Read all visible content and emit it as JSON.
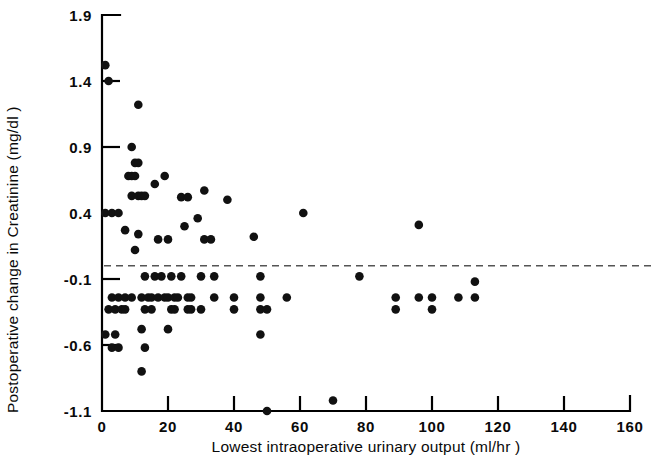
{
  "chart_data": {
    "type": "scatter",
    "title": "",
    "xlabel": "Lowest intraoperative urinary output  (ml/hr )",
    "ylabel": "Postoperative change in Creatinine (mg/dl )",
    "xlim": [
      0,
      160
    ],
    "ylim": [
      -1.1,
      1.9
    ],
    "xticks": [
      0,
      20,
      40,
      60,
      80,
      100,
      120,
      140,
      160
    ],
    "xticklabels": [
      "0",
      "20",
      "40",
      "60",
      "80",
      "100",
      "120",
      "140",
      "160"
    ],
    "yticks": [
      -1.1,
      -0.6,
      -0.1,
      0.4,
      0.9,
      1.4,
      1.9
    ],
    "yticklabels": [
      "-1.1",
      "-0.6",
      "-0.1",
      "0.4",
      "0.9",
      "1.4",
      "1.9"
    ],
    "grid": false,
    "legend": "none",
    "marker": "filled-circle",
    "marker_color": "#111111",
    "annotations": [
      {
        "type": "hline",
        "name": "zero-reference-line",
        "y": 0.0,
        "style": "dashed",
        "color": "#555555"
      }
    ],
    "series": [
      {
        "name": "patients",
        "points": [
          [
            1,
            1.52
          ],
          [
            2,
            1.4
          ],
          [
            1,
            0.4
          ],
          [
            3,
            0.4
          ],
          [
            5,
            0.4
          ],
          [
            11,
            1.22
          ],
          [
            9,
            0.9
          ],
          [
            10,
            0.78
          ],
          [
            11,
            0.78
          ],
          [
            8,
            0.68
          ],
          [
            9,
            0.68
          ],
          [
            10,
            0.68
          ],
          [
            9,
            0.53
          ],
          [
            11,
            0.53
          ],
          [
            12,
            0.53
          ],
          [
            13,
            0.53
          ],
          [
            7,
            0.27
          ],
          [
            11,
            0.24
          ],
          [
            10,
            0.12
          ],
          [
            16,
            0.62
          ],
          [
            19,
            0.68
          ],
          [
            17,
            0.2
          ],
          [
            20,
            0.2
          ],
          [
            24,
            0.52
          ],
          [
            26,
            0.52
          ],
          [
            31,
            0.57
          ],
          [
            29,
            0.36
          ],
          [
            31,
            0.2
          ],
          [
            33,
            0.2
          ],
          [
            25,
            0.3
          ],
          [
            38,
            0.5
          ],
          [
            46,
            0.22
          ],
          [
            61,
            0.4
          ],
          [
            96,
            0.31
          ],
          [
            3,
            -0.24
          ],
          [
            5,
            -0.24
          ],
          [
            7,
            -0.24
          ],
          [
            9,
            -0.24
          ],
          [
            2,
            -0.33
          ],
          [
            4,
            -0.33
          ],
          [
            6,
            -0.33
          ],
          [
            7,
            -0.33
          ],
          [
            13,
            -0.08
          ],
          [
            16,
            -0.08
          ],
          [
            18,
            -0.08
          ],
          [
            21,
            -0.08
          ],
          [
            24,
            -0.08
          ],
          [
            12,
            -0.24
          ],
          [
            14,
            -0.24
          ],
          [
            15,
            -0.24
          ],
          [
            17,
            -0.24
          ],
          [
            19,
            -0.24
          ],
          [
            20,
            -0.24
          ],
          [
            22,
            -0.24
          ],
          [
            23,
            -0.24
          ],
          [
            13,
            -0.33
          ],
          [
            15,
            -0.33
          ],
          [
            12,
            -0.48
          ],
          [
            13,
            -0.62
          ],
          [
            12,
            -0.8
          ],
          [
            1,
            -0.52
          ],
          [
            4,
            -0.52
          ],
          [
            3,
            -0.62
          ],
          [
            5,
            -0.62
          ],
          [
            21,
            -0.33
          ],
          [
            22,
            -0.33
          ],
          [
            20,
            -0.48
          ],
          [
            26,
            -0.24
          ],
          [
            27,
            -0.24
          ],
          [
            26,
            -0.33
          ],
          [
            27,
            -0.33
          ],
          [
            30,
            -0.08
          ],
          [
            30,
            -0.33
          ],
          [
            34,
            -0.08
          ],
          [
            34,
            -0.24
          ],
          [
            40,
            -0.24
          ],
          [
            40,
            -0.33
          ],
          [
            48,
            -0.08
          ],
          [
            48,
            -0.24
          ],
          [
            48,
            -0.33
          ],
          [
            50,
            -0.33
          ],
          [
            48,
            -0.52
          ],
          [
            50,
            -1.1
          ],
          [
            56,
            -0.24
          ],
          [
            70,
            -1.02
          ],
          [
            78,
            -0.08
          ],
          [
            89,
            -0.24
          ],
          [
            89,
            -0.33
          ],
          [
            96,
            -0.24
          ],
          [
            100,
            -0.24
          ],
          [
            100,
            -0.33
          ],
          [
            108,
            -0.24
          ],
          [
            113,
            -0.12
          ],
          [
            113,
            -0.24
          ]
        ]
      }
    ]
  },
  "geometry": {
    "plot_left": 102,
    "plot_right": 630,
    "plot_top": 15,
    "plot_bottom": 411
  }
}
